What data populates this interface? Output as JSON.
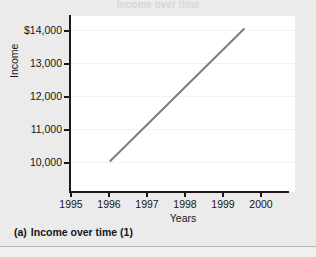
{
  "figure": {
    "caption_letter": "(a)",
    "caption_text": "Income over time (1)",
    "clipped_title": "Income over time"
  },
  "chart_data": {
    "type": "line",
    "title": "",
    "xlabel": "Years",
    "ylabel": "Income",
    "grid": true,
    "legend": "none",
    "xlim": [
      1995,
      2000.7
    ],
    "ylim": [
      9300,
      14700
    ],
    "x_ticks": [
      1995,
      1996,
      1997,
      1998,
      1999,
      2000
    ],
    "x_tick_labels": [
      "1995",
      "1996",
      "1997",
      "1998",
      "1999",
      "2000"
    ],
    "y_ticks": [
      10000,
      11000,
      12000,
      13000,
      14000
    ],
    "y_tick_labels": [
      "10,000",
      "11,000",
      "12,000",
      "13,000",
      "$14,000"
    ],
    "series": [
      {
        "name": "Income",
        "color": "#7d7d7d",
        "x": [
          1996,
          1999.4
        ],
        "values": [
          10250,
          14300
        ]
      }
    ]
  }
}
